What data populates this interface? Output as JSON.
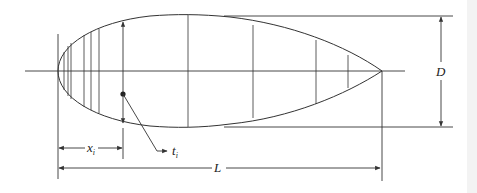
{
  "figure": {
    "labels": {
      "diameter": "D",
      "length": "L",
      "station_position": "x",
      "station_position_subscript": "i",
      "station_thickness": "t",
      "station_thickness_subscript": "i"
    },
    "colors": {
      "line": "#333333",
      "background": "#ffffff",
      "edge_strip": "#f3f3f3"
    }
  }
}
